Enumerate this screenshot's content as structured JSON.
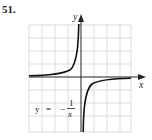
{
  "problem_number": "51.",
  "graph": {
    "x_label": "x",
    "y_label": "y",
    "equation_lhs": "y",
    "equation_eq": "=",
    "equation_sign": "−",
    "equation_num": "1",
    "equation_den": "x",
    "function": "y = -1/x",
    "grid_cols": 8,
    "grid_rows": 8,
    "curve_color": "#111111",
    "grid_color": "#c8c8c8"
  }
}
